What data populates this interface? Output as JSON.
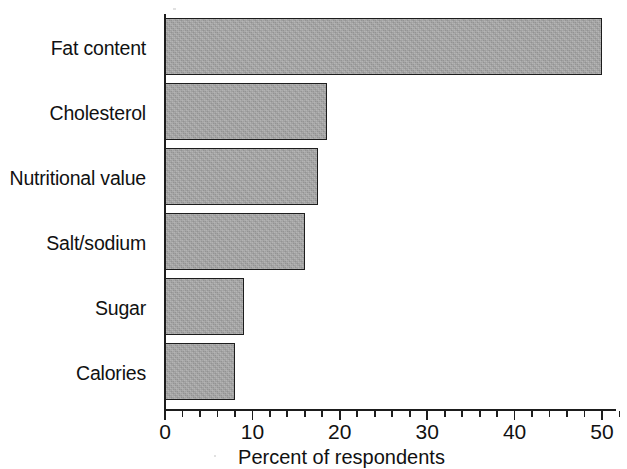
{
  "chart_data": {
    "type": "bar",
    "orientation": "horizontal",
    "title": "",
    "xlabel": "Percent of respondents",
    "ylabel": "",
    "categories": [
      "Fat content",
      "Cholesterol",
      "Nutritional value",
      "Salt/sodium",
      "Sugar",
      "Calories"
    ],
    "values": [
      50,
      18.5,
      17.5,
      16,
      9,
      8
    ],
    "xlim": [
      0,
      52
    ],
    "x_ticks": [
      0,
      10,
      20,
      30,
      40,
      50
    ],
    "x_tick_labels": [
      "0",
      "10",
      "20",
      "30",
      "40",
      "50"
    ],
    "minor_tick_step": 2,
    "grid": false,
    "legend": false,
    "series": [
      {
        "name": "Percent of respondents",
        "values": [
          50,
          18.5,
          17.5,
          16,
          9,
          8
        ]
      }
    ],
    "colors": {
      "bar_fill": "#9b9b9b",
      "bar_border": "#1d1d1d",
      "axis": "#1d1d1d",
      "text": "#111111",
      "background": "#ffffff"
    }
  },
  "axis": {
    "x_title": "Percent of respondents"
  }
}
